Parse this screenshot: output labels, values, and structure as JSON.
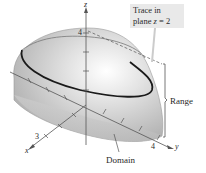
{
  "figure": {
    "callout": {
      "line1": "Trace in",
      "line2_prefix": "plane ",
      "line2_var": "z",
      "line2_suffix": " = 2"
    },
    "labels": {
      "range": "Range",
      "domain": "Domain",
      "x_axis": "x",
      "y_axis": "y",
      "z_axis": "z",
      "x_tick": "3",
      "y_tick": "4",
      "z_tick": "4"
    },
    "colors": {
      "surface_light": "#e8e8e8",
      "surface_dark": "#a8a8a8",
      "trace_curve": "#1a1a1a",
      "axis": "#555555",
      "callout_bg": "#e9e9e9"
    }
  }
}
